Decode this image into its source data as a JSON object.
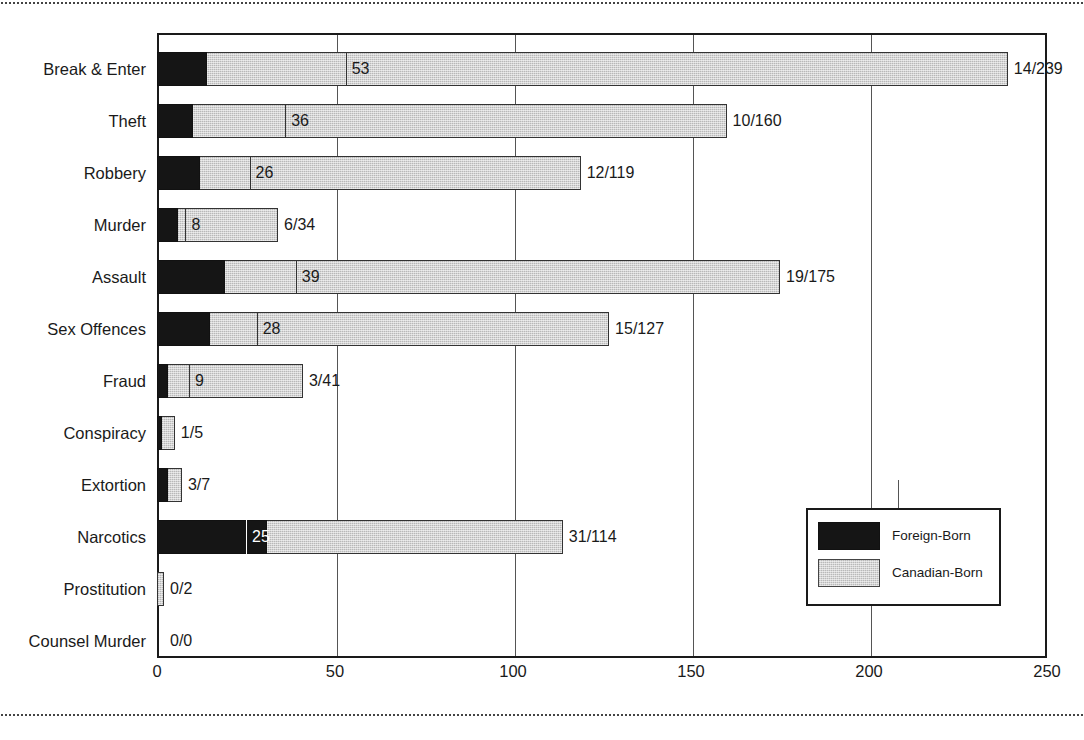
{
  "chart_data": {
    "type": "bar",
    "orientation": "horizontal",
    "title": "",
    "xlabel": "",
    "ylabel": "",
    "xlim": [
      0,
      250
    ],
    "xticks": [
      0,
      50,
      100,
      150,
      200,
      250
    ],
    "xtick_labels": [
      "0",
      "50",
      "100",
      "150",
      "200",
      "250"
    ],
    "grid": true,
    "legend_position": "inside-lower-right",
    "categories": [
      "Break & Enter",
      "Theft",
      "Robbery",
      "Murder",
      "Assault",
      "Sex Offences",
      "Fraud",
      "Conspiracy",
      "Extortion",
      "Narcotics",
      "Prostitution",
      "Counsel Murder"
    ],
    "series": [
      {
        "name": "Foreign-Born",
        "color": "#151515",
        "values": [
          14,
          10,
          12,
          6,
          19,
          15,
          3,
          1,
          3,
          31,
          0,
          0
        ]
      },
      {
        "name": "Canadian-Born",
        "color": "#d4d4d4",
        "values": [
          239,
          160,
          119,
          34,
          175,
          127,
          41,
          5,
          7,
          114,
          2,
          0
        ]
      }
    ],
    "inner_marker_label": "mid-value tick inside bar",
    "inner_markers": [
      53,
      36,
      26,
      8,
      39,
      28,
      9,
      null,
      null,
      25,
      null,
      null
    ],
    "ratio_labels": [
      "14/239",
      "10/160",
      "12/119",
      "6/34",
      "19/175",
      "15/127",
      "3/41",
      "1/5",
      "3/7",
      "31/114",
      "0/2",
      "0/0"
    ]
  },
  "legend": {
    "entries": [
      {
        "label": "Foreign-Born",
        "swatch": "black"
      },
      {
        "label": "Canadian-Born",
        "swatch": "gray"
      }
    ]
  },
  "rows": [
    {
      "category": "Break & Enter",
      "foreign": 14,
      "canadian": 239,
      "inner": "53",
      "ratio": "14/239"
    },
    {
      "category": "Theft",
      "foreign": 10,
      "canadian": 160,
      "inner": "36",
      "ratio": "10/160"
    },
    {
      "category": "Robbery",
      "foreign": 12,
      "canadian": 119,
      "inner": "26",
      "ratio": "12/119"
    },
    {
      "category": "Murder",
      "foreign": 6,
      "canadian": 34,
      "inner": "8",
      "ratio": "6/34"
    },
    {
      "category": "Assault",
      "foreign": 19,
      "canadian": 175,
      "inner": "39",
      "ratio": "19/175"
    },
    {
      "category": "Sex Offences",
      "foreign": 15,
      "canadian": 127,
      "inner": "28",
      "ratio": "15/127"
    },
    {
      "category": "Fraud",
      "foreign": 3,
      "canadian": 41,
      "inner": "9",
      "ratio": "3/41"
    },
    {
      "category": "Conspiracy",
      "foreign": 1,
      "canadian": 5,
      "inner": "",
      "ratio": "1/5"
    },
    {
      "category": "Extortion",
      "foreign": 3,
      "canadian": 7,
      "inner": "",
      "ratio": "3/7"
    },
    {
      "category": "Narcotics",
      "foreign": 31,
      "canadian": 114,
      "inner": "25",
      "ratio": "31/114"
    },
    {
      "category": "Prostitution",
      "foreign": 0,
      "canadian": 2,
      "inner": "",
      "ratio": "0/2"
    },
    {
      "category": "Counsel Murder",
      "foreign": 0,
      "canadian": 0,
      "inner": "",
      "ratio": "0/0"
    }
  ]
}
